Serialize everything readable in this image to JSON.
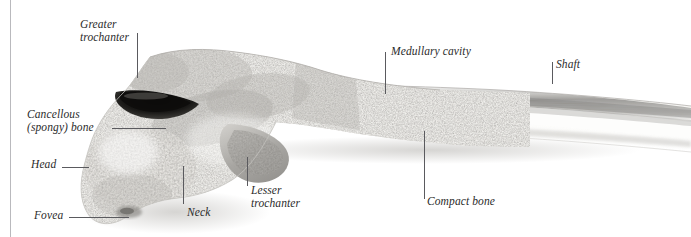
{
  "figure": {
    "background_color": "#ffffff",
    "margin_rule_color": "#b9b9bd",
    "label_color": "#2b2b2b",
    "leader_color": "#5a5a5e",
    "bone_light": "#f2f1ee",
    "bone_mid": "#d8d6d2",
    "bone_dark": "#9a9894",
    "fossa_dark": "#1c1b19"
  },
  "labels": [
    {
      "name": "greater-trochanter",
      "lines": [
        "Greater",
        "trochanter"
      ],
      "text": "Greater\ntrochanter",
      "x": 80,
      "y": 18,
      "align": "left"
    },
    {
      "name": "cancellous-spongy-bone",
      "lines": [
        "Cancellous",
        "(spongy) bone"
      ],
      "text": "Cancellous\n(spongy) bone",
      "x": 27,
      "y": 108,
      "align": "left"
    },
    {
      "name": "head",
      "lines": [
        "Head"
      ],
      "text": "Head",
      "x": 31,
      "y": 158,
      "align": "left"
    },
    {
      "name": "fovea",
      "lines": [
        "Fovea"
      ],
      "text": "Fovea",
      "x": 34,
      "y": 209,
      "align": "left"
    },
    {
      "name": "neck",
      "lines": [
        "Neck"
      ],
      "text": "Neck",
      "x": 187,
      "y": 206,
      "align": "left"
    },
    {
      "name": "lesser-trochanter",
      "lines": [
        "Lesser",
        "trochanter"
      ],
      "text": "Lesser\ntrochanter",
      "x": 251,
      "y": 184,
      "align": "left"
    },
    {
      "name": "medullary-cavity",
      "lines": [
        "Medullary cavity"
      ],
      "text": "Medullary cavity",
      "x": 391,
      "y": 45,
      "align": "left"
    },
    {
      "name": "compact-bone",
      "lines": [
        "Compact bone"
      ],
      "text": "Compact bone",
      "x": 427,
      "y": 195,
      "align": "left"
    },
    {
      "name": "shaft",
      "lines": [
        "Shaft"
      ],
      "text": "Shaft",
      "x": 556,
      "y": 58,
      "align": "left"
    }
  ],
  "leaders": [
    {
      "name": "greater-trochanter-leader",
      "type": "v",
      "x": 137,
      "y": 33,
      "length": 45
    },
    {
      "name": "cancellous-bone-leader",
      "type": "h",
      "x": 112,
      "y": 128,
      "length": 54
    },
    {
      "name": "head-leader",
      "type": "h",
      "x": 62,
      "y": 167,
      "length": 27
    },
    {
      "name": "fovea-leader",
      "type": "h",
      "x": 69,
      "y": 217,
      "length": 60
    },
    {
      "name": "neck-leader",
      "type": "v",
      "x": 183,
      "y": 166,
      "length": 38
    },
    {
      "name": "lesser-trochanter-leader",
      "type": "v",
      "x": 247,
      "y": 157,
      "length": 29
    },
    {
      "name": "medullary-cavity-leader",
      "type": "v",
      "x": 385,
      "y": 52,
      "length": 42
    },
    {
      "name": "compact-bone-leader",
      "type": "v",
      "x": 424,
      "y": 131,
      "length": 68
    },
    {
      "name": "shaft-leader",
      "type": "v",
      "x": 552,
      "y": 62,
      "length": 22
    }
  ]
}
